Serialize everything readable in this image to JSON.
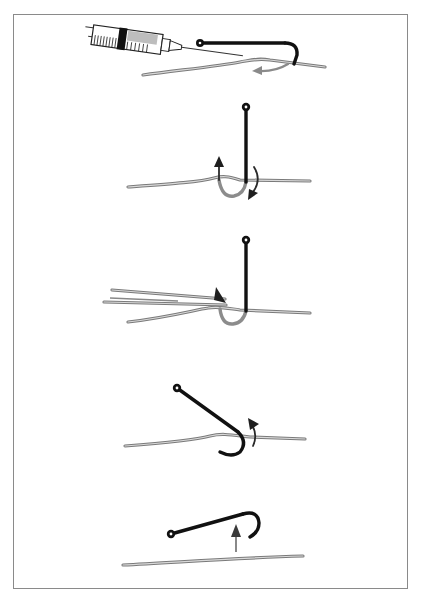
{
  "figure": {
    "kind": "instructional line-art illustration",
    "step_count": 5,
    "colors": {
      "hook": "#111111",
      "buried_hook": "#8c8c8c",
      "line": "#7a7a7a",
      "arrow": "#2a2a2a",
      "frame": "#8a8a8a",
      "background": "#ffffff"
    },
    "steps": [
      {
        "index": 1,
        "elements": [
          "syringe-with-needle",
          "hook-horizontal",
          "line",
          "gray-curved-arrow"
        ]
      },
      {
        "index": 2,
        "elements": [
          "hook-vertical",
          "line",
          "rotation-arrows"
        ]
      },
      {
        "index": 3,
        "elements": [
          "forceps",
          "hook-vertical",
          "line"
        ]
      },
      {
        "index": 4,
        "elements": [
          "hook-tilted",
          "line",
          "curved-arrow-up"
        ]
      },
      {
        "index": 5,
        "elements": [
          "hook-removed",
          "line",
          "upward-arrow"
        ]
      }
    ]
  }
}
